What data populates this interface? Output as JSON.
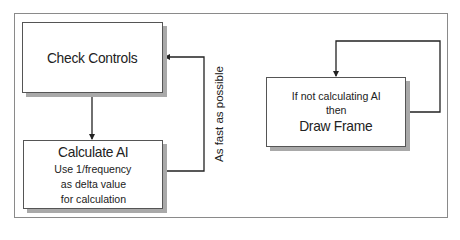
{
  "diagram": {
    "nodes": [
      {
        "id": "check-controls",
        "title": "Check Controls",
        "lines": []
      },
      {
        "id": "calculate-ai",
        "title": "Calculate AI",
        "lines": [
          "Use 1/frequency",
          "as delta value",
          "for calculation"
        ]
      },
      {
        "id": "draw-frame",
        "pre": "If not calculating AI",
        "pre2": "then",
        "title": "Draw Frame"
      }
    ],
    "edges": [
      {
        "from": "check-controls",
        "to": "calculate-ai",
        "label": ""
      },
      {
        "from": "calculate-ai",
        "to": "check-controls",
        "label": "As fast as possible"
      },
      {
        "from": "draw-frame",
        "to": "draw-frame",
        "label": ""
      }
    ],
    "colors": {
      "line": "#222222",
      "box_border": "#555555",
      "shadow": "#a9a9a9",
      "frame": "#8a8a8a"
    }
  }
}
